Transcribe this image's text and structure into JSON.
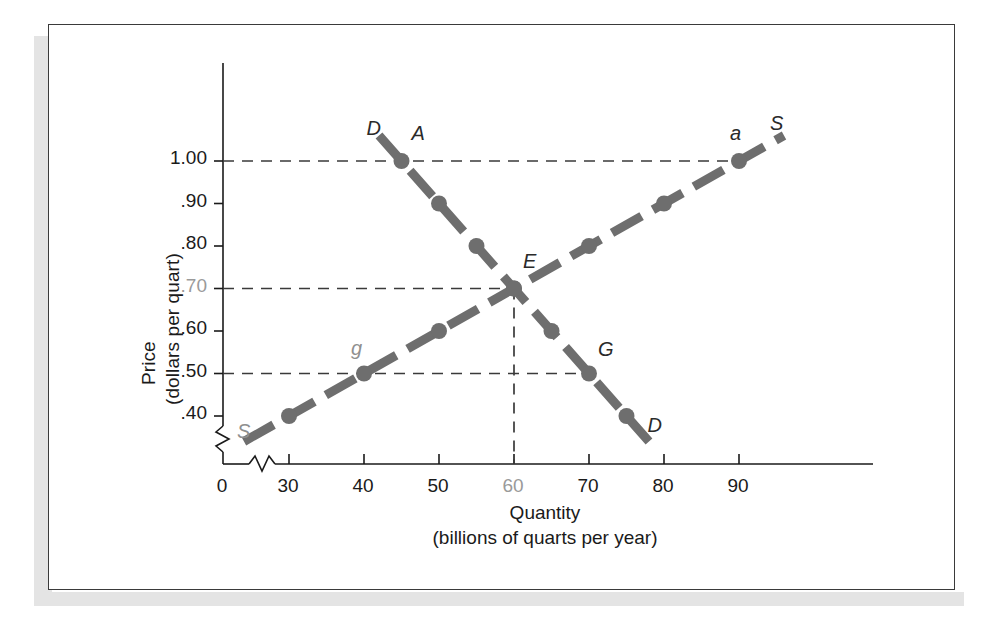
{
  "figure": {
    "kind": "supply-demand-graph"
  },
  "axes": {
    "y_title_line1": "Price",
    "y_title_line2": "(dollars per quart)",
    "x_title_line1": "Quantity",
    "x_title_line2": "(billions of quarts per year)",
    "y_ticks": [
      {
        "label": "1.00",
        "value": 1.0,
        "muted": false
      },
      {
        "label": ".90",
        "value": 0.9,
        "muted": false
      },
      {
        "label": ".80",
        "value": 0.8,
        "muted": false
      },
      {
        "label": ".70",
        "value": 0.7,
        "muted": true
      },
      {
        "label": ".60",
        "value": 0.6,
        "muted": false
      },
      {
        "label": ".50",
        "value": 0.5,
        "muted": false
      },
      {
        "label": ".40",
        "value": 0.4,
        "muted": false
      }
    ],
    "x_ticks": [
      {
        "label": "0",
        "value": 0,
        "muted": false
      },
      {
        "label": "30",
        "value": 30,
        "muted": false
      },
      {
        "label": "40",
        "value": 40,
        "muted": false
      },
      {
        "label": "50",
        "value": 50,
        "muted": false
      },
      {
        "label": "60",
        "value": 60,
        "muted": true
      },
      {
        "label": "70",
        "value": 70,
        "muted": false
      },
      {
        "label": "80",
        "value": 80,
        "muted": false
      },
      {
        "label": "90",
        "value": 90,
        "muted": false
      }
    ],
    "has_axis_breaks": true,
    "break_note": "zigzag break on both axes near origin"
  },
  "curve_labels": {
    "demand_top": "D",
    "demand_bottom": "D",
    "supply_top": "S",
    "supply_bottom": "S"
  },
  "point_labels": {
    "A": "A",
    "a": "a",
    "E": "E",
    "g": "g",
    "G": "G"
  },
  "colors": {
    "curve_gray": "#6e6e6e",
    "axis_black": "#1a1a1a",
    "guide_dash": "#3a3a3a",
    "muted_text": "#9a9a9a",
    "frame_border": "#3a3a3a",
    "page_band": "#e4e4e4"
  },
  "chart_data": {
    "type": "line",
    "title": "",
    "xlabel": "Quantity (billions of quarts per year)",
    "ylabel": "Price (dollars per quart)",
    "xlim": [
      20,
      97
    ],
    "ylim": [
      0.33,
      1.07
    ],
    "grid": false,
    "legend": "inline curve end labels",
    "series": [
      {
        "name": "Demand",
        "label": "D",
        "style": "thick dashed gray with round markers",
        "x": [
          45,
          50,
          55,
          60,
          65,
          70,
          75
        ],
        "y": [
          1.0,
          0.9,
          0.8,
          0.7,
          0.6,
          0.5,
          0.4
        ],
        "marker_points": [
          {
            "x": 45,
            "y": 1.0,
            "label": "A"
          },
          {
            "x": 50,
            "y": 0.9,
            "label": ""
          },
          {
            "x": 55,
            "y": 0.8,
            "label": ""
          },
          {
            "x": 60,
            "y": 0.7,
            "label": "E"
          },
          {
            "x": 65,
            "y": 0.6,
            "label": ""
          },
          {
            "x": 70,
            "y": 0.5,
            "label": "G"
          },
          {
            "x": 75,
            "y": 0.4,
            "label": ""
          }
        ]
      },
      {
        "name": "Supply",
        "label": "S",
        "style": "thick dashed gray with round markers",
        "x": [
          30,
          40,
          50,
          60,
          70,
          80,
          90
        ],
        "y": [
          0.4,
          0.5,
          0.6,
          0.7,
          0.8,
          0.9,
          1.0
        ],
        "marker_points": [
          {
            "x": 30,
            "y": 0.4,
            "label": ""
          },
          {
            "x": 40,
            "y": 0.5,
            "label": "g"
          },
          {
            "x": 50,
            "y": 0.6,
            "label": ""
          },
          {
            "x": 60,
            "y": 0.7,
            "label": "E"
          },
          {
            "x": 70,
            "y": 0.8,
            "label": ""
          },
          {
            "x": 80,
            "y": 0.9,
            "label": ""
          },
          {
            "x": 90,
            "y": 1.0,
            "label": "a"
          }
        ]
      }
    ],
    "equilibrium": {
      "x": 60,
      "y": 0.7,
      "label": "E"
    },
    "guide_lines": [
      {
        "orientation": "horizontal",
        "value": 1.0,
        "style": "dashed"
      },
      {
        "orientation": "horizontal",
        "value": 0.7,
        "style": "dashed"
      },
      {
        "orientation": "horizontal",
        "value": 0.5,
        "style": "dashed"
      },
      {
        "orientation": "vertical",
        "value": 60,
        "style": "dashed"
      }
    ]
  }
}
